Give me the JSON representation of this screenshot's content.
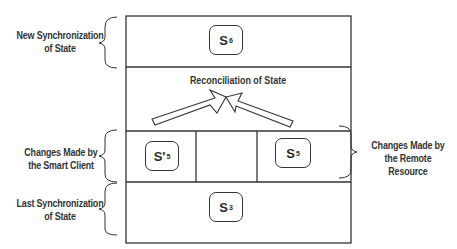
{
  "diagram": {
    "left_labels": {
      "new_sync": [
        "New Synchronization",
        "of State"
      ],
      "smart_client": [
        "Changes Made by",
        "the Smart Client"
      ],
      "last_sync": [
        "Last Synchronization",
        "of State"
      ]
    },
    "right_labels": {
      "remote_resource": [
        "Changes Made by",
        "the Remote Resource"
      ]
    },
    "reconciliation_label": "Reconciliation of State",
    "states": {
      "new": {
        "base": "S",
        "sub": "6"
      },
      "client": {
        "base": "S'",
        "sub": "5"
      },
      "remote": {
        "base": "S",
        "sub": "5"
      },
      "last": {
        "base": "S",
        "sub": "3"
      }
    }
  }
}
